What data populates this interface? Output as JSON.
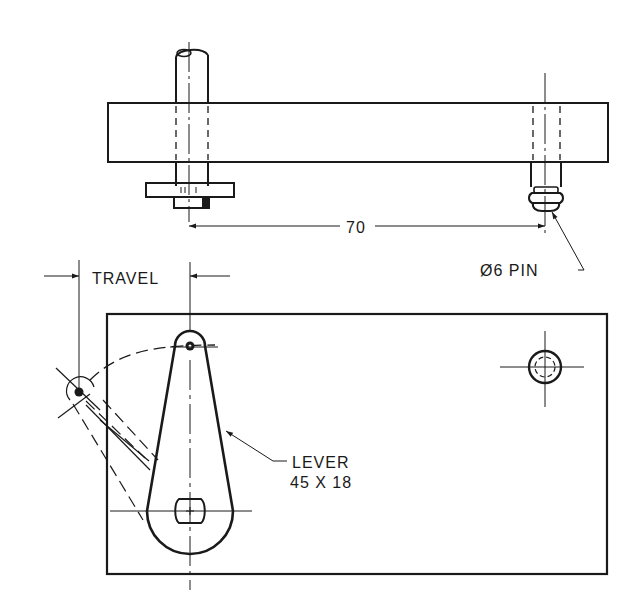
{
  "drawing": {
    "top_view": {
      "dimension_label": "70",
      "pin_label": "Ø6 PIN"
    },
    "front_view": {
      "travel_label": "TRAVEL",
      "lever_label_line1": "LEVER",
      "lever_label_line2": "45 X 18"
    }
  },
  "colors": {
    "ink": "#1a1a1a",
    "background": "#ffffff"
  }
}
